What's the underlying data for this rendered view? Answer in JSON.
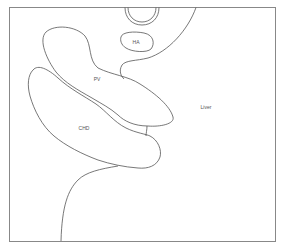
{
  "diagram": {
    "type": "anatomical-outline-sketch",
    "stroke_color": "#555555",
    "frame_color": "#888888",
    "background": "#ffffff",
    "labels": [
      {
        "id": "ha",
        "text": "HA",
        "x": 136,
        "y": 42
      },
      {
        "id": "pv",
        "text": "PV",
        "x": 97,
        "y": 79
      },
      {
        "id": "liver",
        "text": "Liver",
        "x": 206,
        "y": 107
      },
      {
        "id": "chd",
        "text": "CHD",
        "x": 84,
        "y": 128
      }
    ],
    "structures": [
      "circle-top",
      "hepatic-artery",
      "portal-vein",
      "common-hepatic-duct",
      "liver-boundary",
      "lower-boundary"
    ]
  }
}
